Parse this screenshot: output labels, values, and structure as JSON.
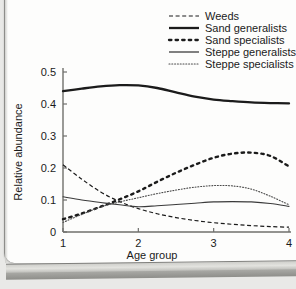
{
  "chart_data": {
    "type": "line",
    "title": "",
    "xlabel": "Age group",
    "ylabel": "Relative abundance",
    "xlim": [
      1,
      4
    ],
    "ylim": [
      0,
      0.5
    ],
    "xticks": [
      "1",
      "2",
      "3",
      "4"
    ],
    "yticks": [
      "0",
      "0.1",
      "0.2",
      "0.3",
      "0.4",
      "0.5"
    ],
    "grid": false,
    "legend_position": "top-right",
    "x": [
      1,
      1.25,
      1.5,
      1.75,
      2,
      2.25,
      2.5,
      2.75,
      3,
      3.25,
      3.5,
      3.75,
      4
    ],
    "series": [
      {
        "name": "Weeds",
        "style": "dashed",
        "values": [
          0.21,
          0.165,
          0.125,
          0.095,
          0.073,
          0.057,
          0.045,
          0.036,
          0.029,
          0.024,
          0.02,
          0.017,
          0.015
        ]
      },
      {
        "name": "Sand generalists",
        "style": "thick-solid",
        "values": [
          0.44,
          0.448,
          0.455,
          0.459,
          0.458,
          0.45,
          0.436,
          0.423,
          0.414,
          0.409,
          0.405,
          0.403,
          0.402
        ]
      },
      {
        "name": "Sand specialists",
        "style": "thick-dotted",
        "values": [
          0.04,
          0.058,
          0.079,
          0.102,
          0.127,
          0.157,
          0.185,
          0.21,
          0.232,
          0.245,
          0.248,
          0.238,
          0.205
        ]
      },
      {
        "name": "Steppe generalists",
        "style": "thin-solid",
        "values": [
          0.11,
          0.1,
          0.092,
          0.085,
          0.079,
          0.082,
          0.086,
          0.09,
          0.094,
          0.095,
          0.094,
          0.089,
          0.08
        ]
      },
      {
        "name": "Steppe specialists",
        "style": "fine-dotted",
        "values": [
          0.03,
          0.055,
          0.078,
          0.094,
          0.107,
          0.12,
          0.131,
          0.14,
          0.145,
          0.144,
          0.134,
          0.112,
          0.085
        ]
      }
    ],
    "annotations": []
  },
  "legend": {
    "items": [
      {
        "label": "Weeds"
      },
      {
        "label": "Sand generalists"
      },
      {
        "label": "Sand specialists"
      },
      {
        "label": "Steppe generalists"
      },
      {
        "label": "Steppe specialists"
      }
    ]
  },
  "colors": {
    "line": "#1b1b1b",
    "axis": "#6f6f6c",
    "paper": "#fdfdfc",
    "background": "#e9e9e7"
  }
}
